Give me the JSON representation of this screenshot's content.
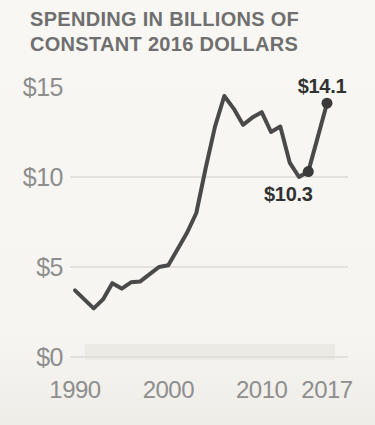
{
  "header": {
    "title_lines": [
      "SPENDING IN BILLIONS OF",
      "CONSTANT 2016 DOLLARS"
    ]
  },
  "chart_data": {
    "type": "line",
    "title": "SPENDING IN BILLIONS OF CONSTANT 2016 DOLLARS",
    "ylabel": "Spending (billions of constant 2016 dollars)",
    "xlabel": "Year",
    "x": [
      1990,
      1991,
      1992,
      1993,
      1994,
      1995,
      1996,
      1997,
      1998,
      1999,
      2000,
      2001,
      2002,
      2003,
      2004,
      2005,
      2006,
      2007,
      2008,
      2009,
      2010,
      2011,
      2012,
      2013,
      2014,
      2015,
      2016,
      2017
    ],
    "values": [
      3.7,
      3.2,
      2.7,
      3.2,
      4.1,
      3.8,
      4.15,
      4.2,
      4.6,
      5.0,
      5.1,
      6.0,
      6.9,
      8.0,
      10.5,
      12.8,
      14.5,
      13.8,
      12.9,
      13.3,
      13.6,
      12.5,
      12.8,
      10.8,
      10.0,
      10.3,
      12.2,
      14.1
    ],
    "xlim": [
      1990,
      2017
    ],
    "ylim": [
      0,
      15
    ],
    "grid": "horizontal",
    "grid_values": [
      0,
      5,
      10
    ],
    "x_ticks": [
      {
        "year": 1990,
        "label": "1990"
      },
      {
        "year": 2000,
        "label": "2000"
      },
      {
        "year": 2010,
        "label": "2010"
      },
      {
        "year": 2017,
        "label": "2017"
      }
    ],
    "y_ticks": [
      {
        "value": 15,
        "label": "$15"
      },
      {
        "value": 10,
        "label": "$10"
      },
      {
        "value": 5,
        "label": "$5"
      },
      {
        "value": 0,
        "label": "$0"
      }
    ],
    "annotations": [
      {
        "year": 2017,
        "value": 14.1,
        "label": "$14.1",
        "placement": "above"
      },
      {
        "year": 2015,
        "value": 10.3,
        "label": "$10.3",
        "placement": "below"
      }
    ],
    "colors": {
      "line": "#4a4a4a",
      "dot": "#3a3a3a",
      "grid": "#dcdad4",
      "axis_label": "#8e8e8e",
      "title": "#6f6f6f",
      "annotation": "#323232",
      "background": "#f6f5f1",
      "baseline_shading": "#eceae4"
    }
  }
}
